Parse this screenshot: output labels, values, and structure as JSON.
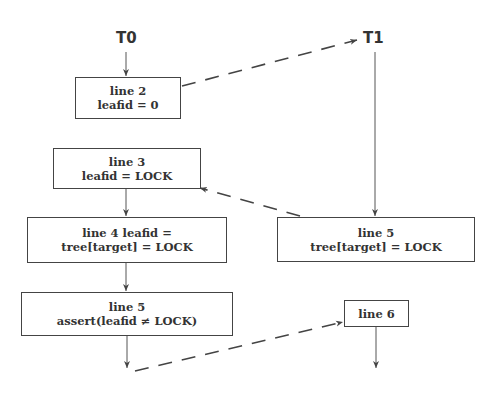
{
  "threads": {
    "t0": "T0",
    "t1": "T1"
  },
  "boxes": {
    "t0_line2": {
      "line1": "line 2",
      "line2": "leafid = 0"
    },
    "t0_line3": {
      "line1": "line 3",
      "line2": "leafid = LOCK"
    },
    "t0_line4": {
      "line1": "line 4 leafid =",
      "line2": "tree[target] = LOCK"
    },
    "t0_line5": {
      "line1": "line 5",
      "line2": "assert(leafid ≠ LOCK)"
    },
    "t1_line5": {
      "line1": "line 5",
      "line2": "tree[target] = LOCK"
    },
    "t1_line6": {
      "line1": "line 6"
    }
  },
  "edges": [
    {
      "from": "T0",
      "to": "t0_line2",
      "style": "solid"
    },
    {
      "from": "t0_line2",
      "to": "T1",
      "style": "dashed"
    },
    {
      "from": "T1",
      "to": "t1_line5",
      "style": "solid"
    },
    {
      "from": "t1_line5",
      "to": "t0_line3",
      "style": "dashed"
    },
    {
      "from": "t0_line3",
      "to": "t0_line4",
      "style": "solid"
    },
    {
      "from": "t0_line4",
      "to": "t0_line5",
      "style": "solid"
    },
    {
      "from": "t0_line5",
      "to": "t0_end",
      "style": "solid"
    },
    {
      "from": "t0_end",
      "to": "t1_line6",
      "style": "dashed"
    },
    {
      "from": "t1_line6",
      "to": "t1_end",
      "style": "solid"
    }
  ],
  "colors": {
    "stroke": "#444444",
    "text": "#333333",
    "background": "#ffffff"
  }
}
